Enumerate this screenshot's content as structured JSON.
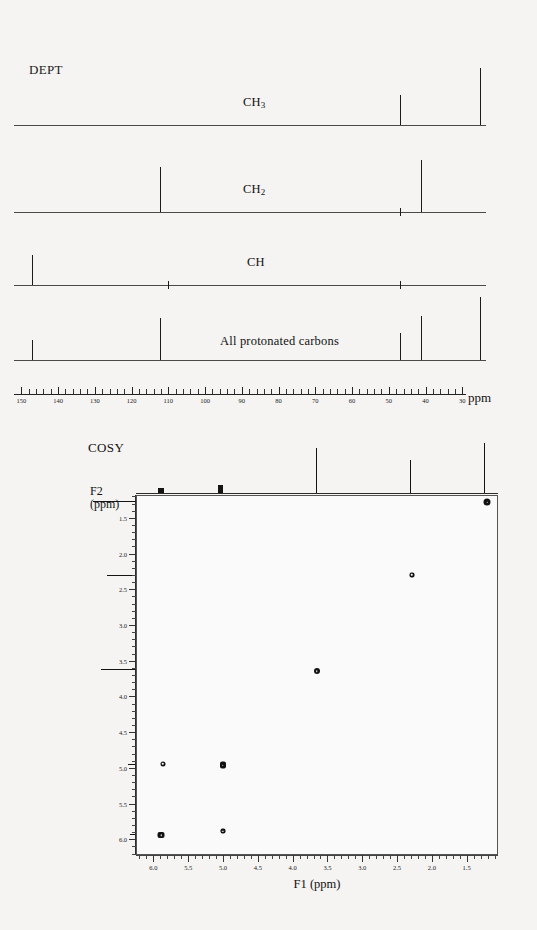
{
  "dept": {
    "title": "DEPT",
    "axis": {
      "unit_label": "ppm",
      "ticks": [
        150,
        140,
        130,
        120,
        110,
        100,
        90,
        80,
        70,
        60,
        50,
        40,
        30
      ],
      "range": [
        152,
        29
      ],
      "left_px": 14,
      "right_px": 466
    },
    "traces": [
      {
        "label": "CH3",
        "label_html": "CH<sub>3</sub>",
        "peaks": [
          {
            "ppm": 47.0,
            "height": 30
          },
          {
            "ppm": 25.3,
            "height": 57
          }
        ],
        "ticks": []
      },
      {
        "label": "CH2",
        "label_html": "CH<sub>2</sub>",
        "peaks": [
          {
            "ppm": 112.2,
            "height": 45
          },
          {
            "ppm": 41.3,
            "height": 52
          }
        ],
        "ticks": [
          47.0
        ]
      },
      {
        "label": "CH",
        "label_html": "CH",
        "peaks": [
          {
            "ppm": 147.0,
            "height": 30
          }
        ],
        "ticks": [
          110.0,
          47.0
        ]
      },
      {
        "label": "All protonated carbons",
        "label_html": "All protonated carbons",
        "peaks": [
          {
            "ppm": 147.0,
            "height": 20
          },
          {
            "ppm": 112.2,
            "height": 42
          },
          {
            "ppm": 47.0,
            "height": 27
          },
          {
            "ppm": 41.3,
            "height": 44
          },
          {
            "ppm": 25.3,
            "height": 63
          }
        ],
        "ticks": []
      }
    ]
  },
  "cosy": {
    "title": "COSY",
    "f2_label_line1": "F2",
    "f2_label_line2": "(ppm)",
    "f1_title": "F1 (ppm)",
    "f1_axis": {
      "ticks": [
        6.0,
        5.5,
        5.0,
        4.5,
        4.0,
        3.5,
        3.0,
        2.5,
        2.0,
        1.5
      ],
      "range": [
        6.25,
        1.05
      ]
    },
    "f2_axis": {
      "ticks": [
        1.5,
        2.0,
        2.5,
        3.0,
        3.5,
        4.0,
        4.5,
        5.0,
        5.5,
        6.0
      ],
      "range": [
        1.18,
        6.22
      ]
    },
    "cross_peaks": [
      {
        "f1": 1.22,
        "f2": 1.27,
        "w": 7,
        "h": 7,
        "shape": "round"
      },
      {
        "f1": 2.3,
        "f2": 2.28,
        "w": 5,
        "h": 5,
        "shape": "square"
      },
      {
        "f1": 3.67,
        "f2": 3.63,
        "w": 6,
        "h": 6,
        "shape": "round"
      },
      {
        "f1": 5.88,
        "f2": 4.93,
        "w": 5,
        "h": 5,
        "shape": "round"
      },
      {
        "f1": 5.02,
        "f2": 4.95,
        "w": 6,
        "h": 7,
        "shape": "square"
      },
      {
        "f1": 5.9,
        "f2": 5.93,
        "w": 7,
        "h": 6,
        "shape": "square"
      },
      {
        "f1": 5.02,
        "f2": 5.87,
        "w": 5,
        "h": 5,
        "shape": "square"
      }
    ],
    "top_projection": {
      "peaks": [
        {
          "f1": 5.89,
          "height": 5,
          "width": 6,
          "blob": true
        },
        {
          "f1": 5.03,
          "height": 8,
          "width": 5,
          "blob": true
        },
        {
          "f1": 3.66,
          "height": 45,
          "width": 1,
          "blob": false
        },
        {
          "f1": 2.3,
          "height": 33,
          "width": 1,
          "blob": false
        },
        {
          "f1": 1.25,
          "height": 50,
          "width": 1,
          "blob": false
        }
      ]
    },
    "left_projection": {
      "peaks": [
        {
          "f2": 1.27,
          "length": 42
        },
        {
          "f2": 2.3,
          "length": 28
        },
        {
          "f2": 3.62,
          "length": 34
        },
        {
          "f2": 4.95,
          "length": 7
        },
        {
          "f2": 5.92,
          "length": 5
        }
      ]
    }
  },
  "chart_data": [
    {
      "type": "line",
      "title": "DEPT",
      "xlabel": "ppm",
      "ylabel": "",
      "xlim": [
        152,
        29
      ],
      "grid": false,
      "legend": "none",
      "xticks": [
        150,
        140,
        130,
        120,
        110,
        100,
        90,
        80,
        70,
        60,
        50,
        40,
        30
      ],
      "series": [
        {
          "name": "CH3",
          "peaks_ppm": [
            47.0,
            25.3
          ],
          "intensities": [
            30,
            57
          ]
        },
        {
          "name": "CH2",
          "peaks_ppm": [
            112.2,
            41.3
          ],
          "intensities": [
            45,
            52
          ]
        },
        {
          "name": "CH",
          "peaks_ppm": [
            147.0
          ],
          "intensities": [
            30
          ]
        },
        {
          "name": "All protonated carbons",
          "peaks_ppm": [
            147.0,
            112.2,
            47.0,
            41.3,
            25.3
          ],
          "intensities": [
            20,
            42,
            27,
            44,
            63
          ]
        }
      ]
    },
    {
      "type": "scatter",
      "title": "COSY",
      "xlabel": "F1 (ppm)",
      "ylabel": "F2 (ppm)",
      "xlim": [
        6.25,
        1.05
      ],
      "ylim": [
        6.22,
        1.18
      ],
      "grid": false,
      "legend": "none",
      "xticks": [
        6.0,
        5.5,
        5.0,
        4.5,
        4.0,
        3.5,
        3.0,
        2.5,
        2.0,
        1.5
      ],
      "yticks": [
        1.5,
        2.0,
        2.5,
        3.0,
        3.5,
        4.0,
        4.5,
        5.0,
        5.5,
        6.0
      ],
      "x": [
        1.22,
        2.3,
        3.67,
        5.88,
        5.02,
        5.9,
        5.02
      ],
      "y": [
        1.27,
        2.28,
        3.63,
        4.93,
        4.95,
        5.93,
        5.87
      ],
      "annotations": [
        "diagonal peaks at 1.25/2.30/3.65/5.0/5.9",
        "cross peaks 5.9-4.95 and 5.0-5.87"
      ]
    }
  ]
}
